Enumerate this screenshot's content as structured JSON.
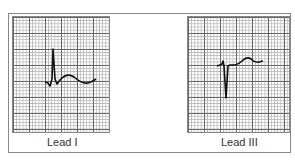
{
  "figure": {
    "panels": [
      {
        "label": "Lead I",
        "description": "tall positive R wave, small S, upright T wave"
      },
      {
        "label": "Lead III",
        "description": "small r, deep negative S wave, upright T wave"
      }
    ]
  },
  "colors": {
    "trace": "#111111",
    "grid_major": "#666666",
    "grid_minor": "#bbbbbb",
    "border": "#888888"
  }
}
